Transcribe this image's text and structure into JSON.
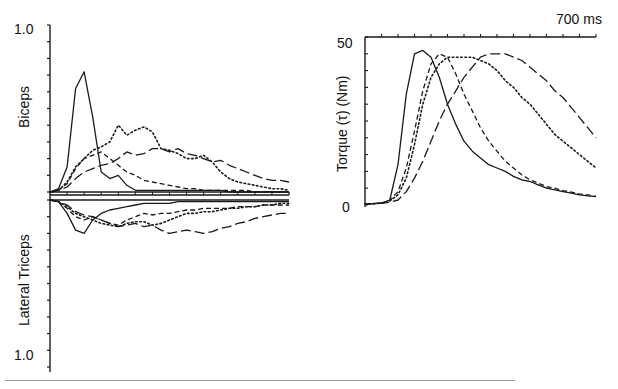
{
  "chart_data": [
    {
      "type": "line",
      "title": "",
      "panel": "left",
      "description": "Normalized EMG activity; biceps plotted upward, lateral triceps plotted downward from a common baseline",
      "upper_ylabel": "Biceps",
      "lower_ylabel": "Lateral Triceps",
      "upper_ytick_label": "1.0",
      "lower_ytick_label": "1.0",
      "ylim_upper": [
        0,
        1.0
      ],
      "ylim_lower": [
        0,
        1.0
      ],
      "x_range_ms": [
        0,
        700
      ],
      "grid": false,
      "legend": null,
      "x": [
        0,
        25,
        50,
        75,
        100,
        125,
        150,
        175,
        200,
        225,
        250,
        275,
        300,
        325,
        350,
        375,
        400,
        425,
        450,
        475,
        500,
        525,
        550,
        575,
        600,
        625,
        650,
        675,
        700
      ],
      "series": [
        {
          "name": "solid",
          "style": "solid",
          "group": "biceps",
          "values": [
            0.0,
            0.02,
            0.15,
            0.62,
            0.72,
            0.45,
            0.12,
            0.08,
            0.1,
            0.04,
            0.01,
            0.01,
            0.01,
            0.01,
            0.01,
            0.01,
            0.01,
            0.01,
            0.01,
            0.01,
            0.01,
            0.0,
            0.0,
            0.0,
            0.0,
            0.0,
            0.0,
            0.0,
            0.0
          ]
        },
        {
          "name": "short-dash",
          "style": "dashed-short",
          "group": "biceps",
          "values": [
            0.0,
            0.01,
            0.05,
            0.14,
            0.2,
            0.22,
            0.24,
            0.2,
            0.16,
            0.12,
            0.1,
            0.07,
            0.06,
            0.05,
            0.04,
            0.03,
            0.02,
            0.02,
            0.01,
            0.01,
            0.01,
            0.01,
            0.01,
            0.01,
            0.0,
            0.0,
            0.0,
            0.0,
            0.0
          ]
        },
        {
          "name": "dotted",
          "style": "dotted",
          "group": "biceps",
          "values": [
            0.0,
            0.01,
            0.06,
            0.15,
            0.2,
            0.25,
            0.27,
            0.3,
            0.4,
            0.34,
            0.37,
            0.39,
            0.36,
            0.26,
            0.25,
            0.23,
            0.2,
            0.2,
            0.22,
            0.18,
            0.12,
            0.08,
            0.06,
            0.05,
            0.04,
            0.03,
            0.02,
            0.02,
            0.01
          ]
        },
        {
          "name": "long-dash",
          "style": "dashed-long",
          "group": "biceps",
          "values": [
            0.0,
            0.01,
            0.03,
            0.08,
            0.12,
            0.14,
            0.16,
            0.17,
            0.2,
            0.24,
            0.22,
            0.23,
            0.26,
            0.26,
            0.24,
            0.26,
            0.23,
            0.22,
            0.2,
            0.18,
            0.19,
            0.16,
            0.14,
            0.12,
            0.1,
            0.08,
            0.07,
            0.07,
            0.06
          ]
        },
        {
          "name": "solid",
          "style": "solid",
          "group": "triceps",
          "values": [
            0.0,
            0.01,
            0.08,
            0.18,
            0.2,
            0.12,
            0.08,
            0.06,
            0.05,
            0.04,
            0.03,
            0.02,
            0.02,
            0.02,
            0.02,
            0.01,
            0.01,
            0.01,
            0.01,
            0.01,
            0.01,
            0.01,
            0.01,
            0.01,
            0.01,
            0.01,
            0.01,
            0.01,
            0.01
          ]
        },
        {
          "name": "short-dash",
          "style": "dashed-short",
          "group": "triceps",
          "values": [
            0.0,
            0.01,
            0.05,
            0.1,
            0.12,
            0.1,
            0.12,
            0.14,
            0.15,
            0.12,
            0.1,
            0.08,
            0.09,
            0.08,
            0.08,
            0.07,
            0.06,
            0.06,
            0.05,
            0.05,
            0.05,
            0.05,
            0.04,
            0.04,
            0.04,
            0.03,
            0.03,
            0.03,
            0.03
          ]
        },
        {
          "name": "dotted",
          "style": "dotted",
          "group": "triceps",
          "values": [
            0.0,
            0.01,
            0.04,
            0.08,
            0.1,
            0.12,
            0.14,
            0.15,
            0.16,
            0.14,
            0.13,
            0.13,
            0.15,
            0.14,
            0.12,
            0.1,
            0.08,
            0.08,
            0.07,
            0.07,
            0.06,
            0.05,
            0.05,
            0.04,
            0.04,
            0.03,
            0.03,
            0.02,
            0.02
          ]
        },
        {
          "name": "long-dash",
          "style": "dashed-long",
          "group": "triceps",
          "values": [
            0.0,
            0.01,
            0.03,
            0.07,
            0.09,
            0.1,
            0.12,
            0.14,
            0.16,
            0.15,
            0.14,
            0.16,
            0.15,
            0.18,
            0.2,
            0.19,
            0.18,
            0.19,
            0.2,
            0.19,
            0.17,
            0.16,
            0.14,
            0.13,
            0.11,
            0.1,
            0.09,
            0.08,
            0.08
          ]
        }
      ]
    },
    {
      "type": "line",
      "title": "",
      "panel": "right",
      "xlabel": "700 ms",
      "ylabel": "Torque (τ) (Nm)",
      "ytick_labels": [
        "0",
        "50"
      ],
      "ylim": [
        0,
        50
      ],
      "x_range_ms": [
        0,
        700
      ],
      "grid": false,
      "legend": null,
      "x": [
        0,
        25,
        50,
        75,
        100,
        125,
        150,
        175,
        200,
        225,
        250,
        275,
        300,
        325,
        350,
        375,
        400,
        425,
        450,
        475,
        500,
        525,
        550,
        575,
        600,
        625,
        650,
        675,
        700
      ],
      "series": [
        {
          "name": "solid",
          "style": "solid",
          "values": [
            0.3,
            0.4,
            0.6,
            1.5,
            12,
            33,
            45,
            46,
            44,
            38,
            30,
            24,
            19,
            16,
            14,
            12,
            11,
            10,
            8.5,
            7.5,
            7,
            6,
            5,
            4.5,
            4,
            3.5,
            3,
            2.7,
            2.5
          ]
        },
        {
          "name": "short-dash",
          "style": "dashed-short",
          "values": [
            0.3,
            0.4,
            0.6,
            1.3,
            4,
            11,
            22,
            34,
            42,
            45,
            44,
            39,
            33,
            28,
            23,
            19,
            16,
            13,
            11,
            9,
            7.5,
            6.5,
            5.5,
            5,
            4.3,
            3.8,
            3.3,
            3,
            2.6
          ]
        },
        {
          "name": "dotted",
          "style": "dotted",
          "values": [
            0.3,
            0.4,
            0.6,
            1.2,
            3,
            8,
            18,
            30,
            38,
            42,
            44,
            44,
            44,
            44,
            43,
            42,
            40,
            37,
            35,
            32,
            30,
            27,
            24,
            21,
            19,
            17,
            15,
            13,
            11
          ]
        },
        {
          "name": "long-dash",
          "style": "dashed-long",
          "values": [
            0.3,
            0.4,
            0.5,
            0.8,
            1.5,
            4,
            8,
            13,
            19,
            25,
            30,
            34,
            38,
            41,
            44,
            45,
            45,
            45,
            44,
            43,
            41,
            39,
            37,
            34,
            32,
            29,
            26,
            23,
            20
          ]
        }
      ]
    }
  ],
  "labels": {
    "left_top_tick": "1.0",
    "left_bottom_tick": "1.0",
    "biceps": "Biceps",
    "triceps": "Lateral Triceps",
    "right_top_tick": "50",
    "right_bottom_tick": "0",
    "torque": "Torque (τ) (Nm)",
    "time_label": "700 ms"
  },
  "styles": {
    "ink": "#1a1a1a",
    "rule": "#9a9a9a"
  }
}
